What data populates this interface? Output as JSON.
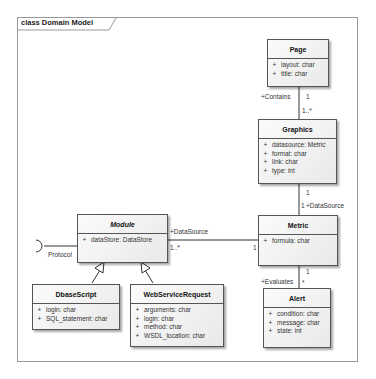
{
  "diagram": {
    "frame_title": "class Domain Model",
    "classes": {
      "page": {
        "name": "Page",
        "attributes": [
          {
            "vis": "+",
            "text": "layout: char"
          },
          {
            "vis": "+",
            "text": "title: char"
          }
        ]
      },
      "graphics": {
        "name": "Graphics",
        "attributes": [
          {
            "vis": "+",
            "text": "datasource: Metric"
          },
          {
            "vis": "+",
            "text": "format: char"
          },
          {
            "vis": "+",
            "text": "link: char"
          },
          {
            "vis": "+",
            "text": "type: int"
          }
        ]
      },
      "metric": {
        "name": "Metric",
        "attributes": [
          {
            "vis": "+",
            "text": "formula: char"
          }
        ]
      },
      "alert": {
        "name": "Alert",
        "attributes": [
          {
            "vis": "+",
            "text": "condition: char"
          },
          {
            "vis": "+",
            "text": "message: char"
          },
          {
            "vis": "+",
            "text": "state: int"
          }
        ]
      },
      "module": {
        "name": "Module",
        "abstract": true,
        "attributes": [
          {
            "vis": "+",
            "text": "dataStore: DataStore"
          }
        ]
      },
      "dbscript": {
        "name": "DbaseScript",
        "attributes": [
          {
            "vis": "+",
            "text": "login: char"
          },
          {
            "vis": "+",
            "text": "SQL_statement: char"
          }
        ]
      },
      "webservice": {
        "name": "WebServiceRequest",
        "attributes": [
          {
            "vis": "+",
            "text": "arguments: char"
          },
          {
            "vis": "+",
            "text": "login: char"
          },
          {
            "vis": "+",
            "text": "method: char"
          },
          {
            "vis": "+",
            "text": "WSDL_location: char"
          }
        ]
      }
    },
    "relations": {
      "page_graphics": {
        "role": "+Contains",
        "source_mult": "1",
        "target_mult": "1..*"
      },
      "graphics_metric": {
        "role": "+DataSource",
        "source_mult": "1",
        "target_mult": "1"
      },
      "metric_alert": {
        "role": "+Evaluates",
        "source_mult": "1",
        "target_mult": "*"
      },
      "module_metric": {
        "role": "+DataSource",
        "source_mult": "1..*",
        "target_mult": "1"
      },
      "interface": {
        "name": "Protocol"
      }
    }
  }
}
